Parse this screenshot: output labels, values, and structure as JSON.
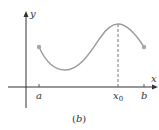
{
  "figure": {
    "caption": "(b)",
    "axes": {
      "x_label": "x",
      "y_label": "y"
    },
    "ticks": [
      {
        "name": "a",
        "label": "a"
      },
      {
        "name": "x0",
        "label": "x",
        "subscript": "0"
      },
      {
        "name": "b",
        "label": "b"
      }
    ],
    "curve": {
      "description": "continuous function on [a,b] with endpoint markers; maximum at x0",
      "color": "#9a9a9a"
    },
    "colors": {
      "axis": "#333333",
      "curve": "#9a9a9a",
      "endpoint": "#a6a6a6",
      "dashed": "#555555"
    }
  }
}
